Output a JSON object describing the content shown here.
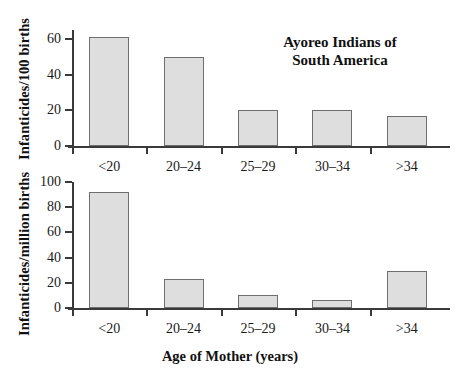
{
  "figure": {
    "xlabel": "Age of Mother (years)",
    "categories": [
      "<20",
      "20–24",
      "25–29",
      "30–34",
      ">34"
    ],
    "bar_fill": "#dedede",
    "bar_border": "#6e6e6e",
    "axis_color": "#3a3a3a"
  },
  "panels": {
    "top": {
      "title": "Ayoreo Indians of\nSouth America",
      "ylabel": "Infanticides/100 births",
      "yticks": [
        "0",
        "20",
        "40",
        "60"
      ]
    },
    "bottom": {
      "title": "Canada, 1974–1983",
      "ylabel": "Infanticides/million births",
      "yticks": [
        "0",
        "20",
        "40",
        "60",
        "80",
        "100"
      ]
    }
  },
  "chart_data": [
    {
      "type": "bar",
      "title": "Ayoreo Indians of South America",
      "xlabel": "Age of Mother (years)",
      "ylabel": "Infanticides/100 births",
      "categories": [
        "<20",
        "20–24",
        "25–29",
        "30–34",
        ">34"
      ],
      "values": [
        61,
        50,
        20,
        20,
        17
      ],
      "ylim": [
        0,
        65
      ],
      "yticks": [
        0,
        20,
        40,
        60
      ],
      "grid": false,
      "legend": null
    },
    {
      "type": "bar",
      "title": "Canada, 1974–1983",
      "xlabel": "Age of Mother (years)",
      "ylabel": "Infanticides/million births",
      "categories": [
        "<20",
        "20–24",
        "25–29",
        "30–34",
        ">34"
      ],
      "values": [
        92,
        23,
        10,
        6,
        29
      ],
      "ylim": [
        0,
        100
      ],
      "yticks": [
        0,
        20,
        40,
        60,
        80,
        100
      ],
      "grid": false,
      "legend": null
    }
  ]
}
